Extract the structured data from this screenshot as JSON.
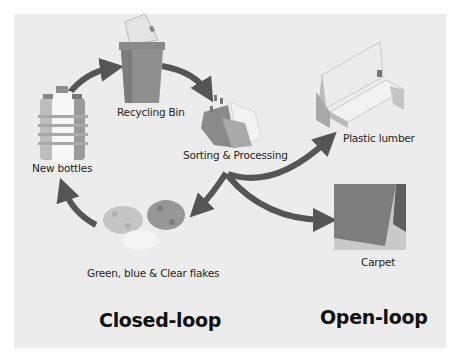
{
  "diagram": {
    "title_closed": "Closed-loop",
    "title_open": "Open-loop",
    "nodes": {
      "recycling_bin": "Recycling Bin",
      "sorting": "Sorting & Processing",
      "flakes": "Green, blue & Clear flakes",
      "new_bottles": "New bottles",
      "plastic_lumber": "Plastic lumber",
      "carpet": "Carpet"
    },
    "icons": [
      "recycling-bin-icon",
      "sorted-bottles-icon",
      "plastic-flakes-icon",
      "new-bottles-icon",
      "bench-icon",
      "carpet-image"
    ],
    "edges": [
      {
        "from": "New bottles",
        "to": "Recycling Bin"
      },
      {
        "from": "Recycling Bin",
        "to": "Sorting & Processing"
      },
      {
        "from": "Sorting & Processing",
        "to": "Green, blue & Clear flakes"
      },
      {
        "from": "Green, blue & Clear flakes",
        "to": "New bottles"
      },
      {
        "from": "Sorting & Processing",
        "to": "Plastic lumber"
      },
      {
        "from": "Sorting & Processing",
        "to": "Carpet"
      }
    ],
    "colors": {
      "background": "#ececec",
      "arrow": "#555555",
      "text": "#1e1e1e"
    }
  }
}
